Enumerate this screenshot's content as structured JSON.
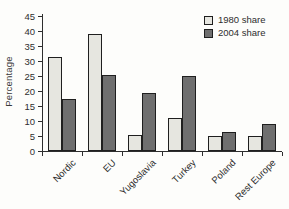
{
  "chart_data": {
    "type": "bar",
    "title": "",
    "xlabel": "",
    "ylabel": "Percentage",
    "ylim": [
      0,
      45
    ],
    "ytick_step": 5,
    "grid": false,
    "legend_position": "top-right",
    "categories": [
      "Nordic",
      "EU",
      "Yugoslavia",
      "Turkey",
      "Poland",
      "Rest Europe"
    ],
    "series": [
      {
        "name": "1980 share",
        "values": [
          31.5,
          39,
          5.5,
          11,
          5,
          5
        ],
        "color": "#e6e6e0"
      },
      {
        "name": "2004 share",
        "values": [
          17.5,
          25.5,
          19.5,
          25,
          6.5,
          9
        ],
        "color": "#6f6f6f"
      }
    ],
    "colors": {
      "axis": "#2e2e2e",
      "bar_border": "#1f1f1f",
      "background": "#fdfdfb",
      "text": "#2e2e2e"
    }
  }
}
